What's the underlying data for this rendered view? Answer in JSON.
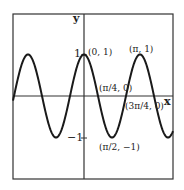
{
  "figure": {
    "function": "y = cos(2x)",
    "axis_labels": {
      "x": "x",
      "y": "y"
    },
    "ticks": {
      "y_pos": "1",
      "y_neg": "−1"
    },
    "points": [
      {
        "label": "(0, 1)"
      },
      {
        "label": "(π, 1)"
      },
      {
        "label": "(π/4, 0)"
      },
      {
        "label": "(3π/4, 0)"
      },
      {
        "label": "(π/2, −1)"
      }
    ],
    "colors": {
      "curve": "#1a1a1a",
      "axes": "#333333",
      "frame": "#333333"
    }
  }
}
